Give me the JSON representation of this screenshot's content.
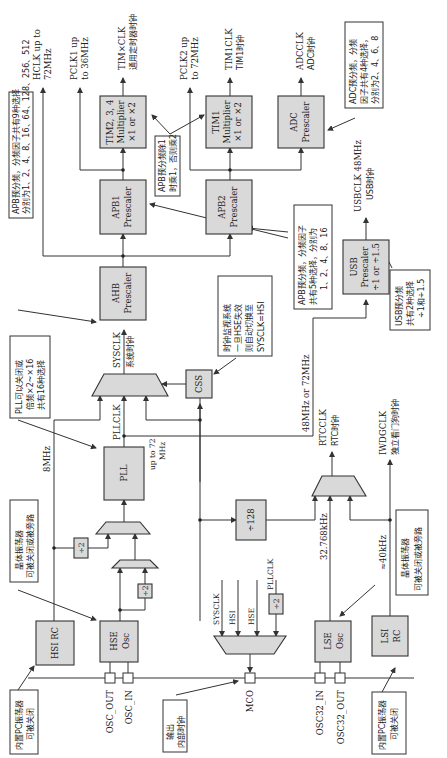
{
  "blocks": {
    "hsi_rc": "HSI RC",
    "hse_osc": [
      "HSE",
      "Osc"
    ],
    "lse_osc": [
      "LSE",
      "Osc"
    ],
    "lsi_rc": [
      "LSI",
      "RC"
    ],
    "pll": "PLL",
    "css": "CSS",
    "ahb": [
      "AHB",
      "Prescaler"
    ],
    "apb1": [
      "APB1",
      "Prescaler"
    ],
    "apb2": [
      "APB2",
      "Prescaler"
    ],
    "tim234": [
      "TIM2, 3, 4",
      "Multiplier",
      "×1 or ×2"
    ],
    "tim1": [
      "TIM1",
      "Multiplier",
      "×1 or ×2"
    ],
    "adc": [
      "ADC",
      "Prescaler"
    ],
    "usb": [
      "USB",
      "Prescaler",
      "÷1 or ÷1.5"
    ],
    "div128": "÷128",
    "div2_hsi": "÷2",
    "div2_hse": "÷2",
    "div2_pll": "÷2"
  },
  "pins": {
    "osc_out": "OSC_OUT",
    "osc_in": "OSC_IN",
    "mco": "MCO",
    "osc32_in": "OSC32_IN",
    "osc32_out": "OSC32_OUT"
  },
  "signals": {
    "hclk": [
      "HCLK up to",
      "72MHz"
    ],
    "pclk1": [
      "PCLK1 up",
      "to 36MHz"
    ],
    "timxclk": [
      "TIM×CLK",
      "通用定时器时钟"
    ],
    "pclk2": [
      "PCLK2 up",
      "to 72MHz"
    ],
    "tim1clk": [
      "TIM1CLK",
      "TIM1时钟"
    ],
    "adcclk": [
      "ADCCLK",
      "ADC时钟"
    ],
    "usbclk": [
      "USBCLK 48MHz",
      "USB时钟"
    ],
    "sysclk": [
      "SYSCLK",
      "系统时钟"
    ],
    "pllclk": "PLLCLK",
    "up_to_72": [
      "up to 72",
      "MHz"
    ],
    "mhz8": "8MHz",
    "usb_in": "48MHz or 72MHz",
    "rtcclk": [
      "RTCCLK",
      "RTC时钟"
    ],
    "iwdgclk": [
      "IWDGCLK",
      "独立看门狗时钟"
    ],
    "khz32768": "32.768kHz",
    "khz40": "≈40kHz",
    "mco_sysclk": "SYSCLK",
    "mco_hsi": "HSI",
    "mco_hse": "HSE",
    "mco_pllclk": "PLLCLK"
  },
  "notes": {
    "apb_main": [
      "APB预分频，分频因子共有9种选择",
      "分别为1、2、4、8、16、64、128、256、512"
    ],
    "apb_mult": [
      "APB预分频除1",
      "时乘1，否则乘2"
    ],
    "adc_note": [
      "ADC预分频，分频",
      "因子共有4种选择，",
      "分别为2、4、6、8"
    ],
    "apb2_note": [
      "APB预分频，分频因子",
      "共有5种选择，分别为",
      "1、2、4、8、16"
    ],
    "css_note": [
      "时钟监视系统",
      "一旦HSE失效",
      "则自动切换至",
      "SYSCLK=HSI"
    ],
    "usb_note": [
      "USB预分频",
      "共有2种选择",
      "÷1和÷1.5"
    ],
    "pll_note": [
      "PLL可以关闭或",
      "倍频×2~×16",
      "共有16种选择"
    ],
    "hse_note": [
      "晶体振荡器",
      "可被关闭或被旁路"
    ],
    "hsi_note": [
      "内置PC振荡器",
      "可被关闭"
    ],
    "mco_note": [
      "输出",
      "内部时钟"
    ],
    "lse_note": [
      "晶体振荡器",
      "可被关闭或被旁路"
    ],
    "lsi_note": [
      "内置PC振荡器",
      "可被关闭"
    ]
  }
}
